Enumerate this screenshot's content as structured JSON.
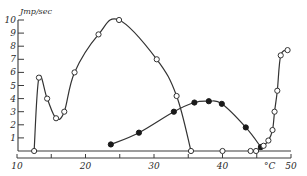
{
  "chart_data": {
    "type": "line",
    "title": "",
    "xlabel": "°C",
    "ylabel": "Jmp/sec",
    "xlim": [
      10,
      50
    ],
    "ylim": [
      0,
      10
    ],
    "x_ticks_major": [
      10,
      20,
      30,
      40,
      50
    ],
    "x_ticks_minor": [
      15,
      25,
      35,
      45
    ],
    "x_tick_labels": [
      "10",
      "20",
      "30",
      "40",
      "50"
    ],
    "y_ticks": [
      0,
      1,
      2,
      3,
      4,
      5,
      6,
      7,
      8,
      9,
      10
    ],
    "y_tick_labels": [
      "1",
      "2",
      "3",
      "4",
      "5",
      "6",
      "7",
      "8",
      "9",
      "10"
    ],
    "grid": false,
    "series": [
      {
        "name": "open-circles-low-temp",
        "marker": "open-circle",
        "x": [
          12.5,
          13.2,
          14.4,
          15.7,
          16.9,
          18.4,
          21.9,
          24.9,
          30.4,
          33.3,
          35.4
        ],
        "y": [
          0,
          5.6,
          4.0,
          2.5,
          3.0,
          6.0,
          8.9,
          10.0,
          7.0,
          4.2,
          0
        ]
      },
      {
        "name": "filled-circles",
        "marker": "filled-circle",
        "x": [
          23.7,
          27.8,
          32.9,
          35.9,
          38.0,
          39.9,
          43.4,
          45.6
        ],
        "y": [
          0.5,
          1.4,
          3.0,
          3.7,
          3.8,
          3.6,
          1.8,
          0.3
        ]
      },
      {
        "name": "open-circles-baseline",
        "marker": "open-circle",
        "x": [
          40.0
        ],
        "y": [
          0
        ]
      },
      {
        "name": "open-circles-high-temp",
        "marker": "open-circle",
        "x": [
          44.1,
          44.9,
          46.0,
          46.7,
          47.3,
          47.6,
          48.0,
          48.5,
          49.5
        ],
        "y": [
          0,
          0,
          0.4,
          0.8,
          1.6,
          3.0,
          4.6,
          7.3,
          7.7
        ]
      }
    ]
  }
}
